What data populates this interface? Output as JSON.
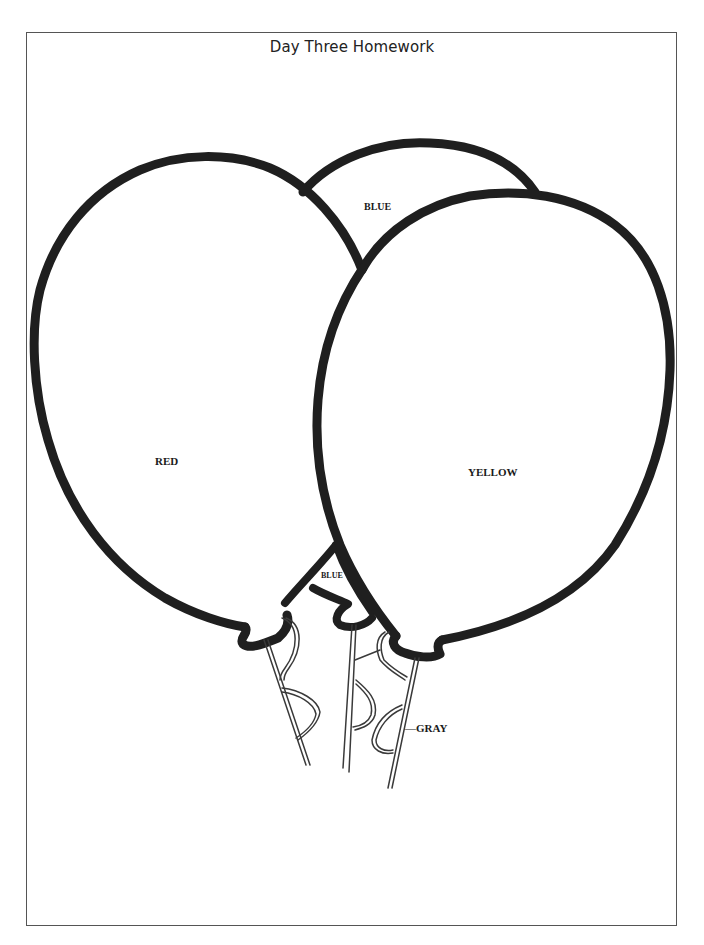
{
  "document": {
    "title": "Day Three Homework"
  },
  "balloons": {
    "blue_back": {
      "label": "BLUE",
      "color_name": "blue"
    },
    "red": {
      "label": "RED",
      "color_name": "red"
    },
    "yellow": {
      "label": "YELLOW",
      "color_name": "yellow"
    },
    "blue_small": {
      "label": "BLUE",
      "color_name": "blue"
    }
  },
  "strings": {
    "label": "—GRAY",
    "color_name": "gray"
  },
  "colors": {
    "outline": "#1f1f1f",
    "frame": "#555555",
    "background": "#ffffff"
  }
}
